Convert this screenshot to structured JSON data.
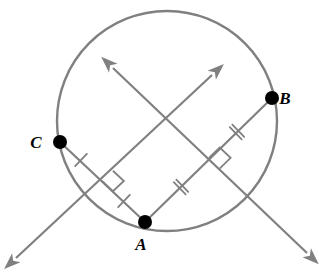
{
  "figure": {
    "background_color": "#ffffff",
    "stroke_color": "#808080",
    "point_color": "#000000",
    "label_color": "#000000"
  },
  "circle": {
    "name": "circle-outline",
    "center_x": 167,
    "center_y": 121,
    "radius": 110,
    "stroke_width": 2.4
  },
  "points": [
    {
      "id": "A",
      "label": "A",
      "x": 145,
      "y": 222,
      "label_x": 141,
      "label_y": 250,
      "radius": 7
    },
    {
      "id": "B",
      "label": "B",
      "x": 272,
      "y": 98,
      "label_x": 285,
      "label_y": 104,
      "radius": 7
    },
    {
      "id": "C",
      "label": "C",
      "x": 60,
      "y": 142,
      "label_x": 36,
      "label_y": 148,
      "radius": 7
    }
  ],
  "chords": [
    {
      "name": "chord-CA",
      "from": "C",
      "to": "A",
      "x1": 60,
      "y1": 142,
      "x2": 145,
      "y2": 222
    },
    {
      "name": "chord-AB",
      "from": "A",
      "to": "B",
      "x1": 145,
      "y1": 222,
      "x2": 272,
      "y2": 98
    }
  ],
  "rays": [
    {
      "name": "perpendicular-bisector-of-CA",
      "description": "double-headed ray through midpoint of chord CA, pointing up-right and down-left",
      "x1": 16,
      "y1": 258,
      "x2": 212,
      "y2": 75,
      "arrow_start": true,
      "arrow_end": true
    },
    {
      "name": "perpendicular-bisector-of-AB",
      "description": "double-headed ray through midpoint of chord AB, pointing up-left and down-right",
      "x1": 113,
      "y1": 68,
      "x2": 307,
      "y2": 253,
      "arrow_start": true,
      "arrow_end": true
    }
  ],
  "tick_marks": [
    {
      "name": "tick-C-to-midpoint",
      "segment": "chord-CA",
      "count": 1,
      "x": 81,
      "y": 160
    },
    {
      "name": "tick-midpoint-to-A",
      "segment": "chord-CA",
      "count": 1,
      "x": 124,
      "y": 201
    },
    {
      "name": "tick-A-to-midpoint",
      "segment": "chord-AB",
      "count": 2,
      "x": 181,
      "y": 187
    },
    {
      "name": "tick-midpoint-to-B",
      "segment": "chord-AB",
      "count": 2,
      "x": 237,
      "y": 132
    }
  ],
  "right_angle_marks": [
    {
      "name": "right-angle-at-midpoint-CA",
      "x": 102,
      "y": 181,
      "size": 15
    },
    {
      "name": "right-angle-at-midpoint-AB",
      "x": 209,
      "y": 158,
      "size": 15
    }
  ],
  "labels": {
    "point_a": "A",
    "point_b": "B",
    "point_c": "C"
  }
}
